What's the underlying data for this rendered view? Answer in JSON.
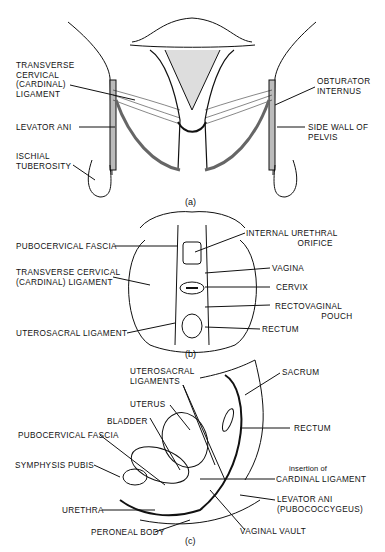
{
  "panels": {
    "a": {
      "caption": "(a)",
      "labels": {
        "transverse_cervical": "TRANSVERSE\nCERVICAL\n(CARDINAL)\nLIGAMENT",
        "levator_ani": "LEVATOR ANI",
        "ischial_tuberosity": "ISCHIAL\nTUBEROSITY",
        "obturator_internus": "OBTURATOR\nINTERNUS",
        "side_wall": "SIDE WALL OF\nPELVIS"
      }
    },
    "b": {
      "caption": "(b)",
      "labels": {
        "pubocervical_fascia": "PUBOCERVICAL FASCIA",
        "transverse_cervical": "TRANSVERSE CERVICAL\n(CARDINAL) LIGAMENT",
        "uterosacral_ligament": "UTEROSACRAL LIGAMENT",
        "internal_urethral_orifice": "INTERNAL URETHRAL\n                    ORIFICE",
        "vagina": "VAGINA",
        "cervix": "CERVIX",
        "rectovaginal_pouch": "RECTOVAGINAL\n                  POUCH",
        "rectum": "RECTUM"
      }
    },
    "c": {
      "caption": "(c)",
      "labels": {
        "uterosacral_ligaments": "UTEROSACRAL\nLIGAMENTS",
        "uterus": "UTERUS",
        "bladder": "BLADDER",
        "pubocervical_fascia": "PUBOCERVICAL FASCIA",
        "symphysis_pubis": "SYMPHYSIS PUBIS",
        "urethra": "URETHRA",
        "peroneal_body": "PERONEAL BODY",
        "sacrum": "SACRUM",
        "rectum": "RECTUM",
        "insertion_of": "insertion of",
        "cardinal_ligament": "CARDINAL LIGAMENT",
        "levator_ani": "LEVATOR ANI\n(PUBOCOCCYGEUS)",
        "vaginal_vault": "VAGINAL VAULT"
      }
    }
  }
}
